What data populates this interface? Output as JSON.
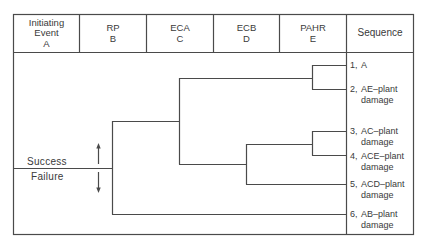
{
  "colors": {
    "line": "#4a4a4a",
    "text": "#3a3a3a",
    "background": "#ffffff"
  },
  "header": {
    "columns": [
      {
        "lines": [
          "Initiating",
          "Event",
          "A"
        ]
      },
      {
        "lines": [
          "RP",
          "B"
        ]
      },
      {
        "lines": [
          "ECA",
          "C"
        ]
      },
      {
        "lines": [
          "ECB",
          "D"
        ]
      },
      {
        "lines": [
          "PAHR",
          "E"
        ]
      },
      {
        "lines": [
          "Sequence"
        ]
      }
    ]
  },
  "legend": {
    "success": "Success",
    "failure": "Failure",
    "up_arrow": "arrow-up-icon",
    "down_arrow": "arrow-down-icon"
  },
  "sequences": [
    {
      "num": "1,",
      "line1": "A",
      "line2": ""
    },
    {
      "num": "2,",
      "line1": "AE–plant",
      "line2": "damage"
    },
    {
      "num": "3,",
      "line1": "AC–plant",
      "line2": "damage"
    },
    {
      "num": "4,",
      "line1": "ACE–plant",
      "line2": "damage"
    },
    {
      "num": "5,",
      "line1": "ACD–plant",
      "line2": "damage"
    },
    {
      "num": "6,",
      "line1": "AB–plant",
      "line2": "damage"
    }
  ]
}
